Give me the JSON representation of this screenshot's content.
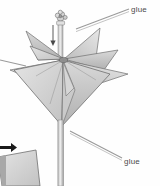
{
  "illustration": {
    "title": "Folded paper star flower on a stick",
    "type": "craft-assembly-diagram",
    "background_color": "#fefefe"
  },
  "labels": {
    "top_glue": "glue",
    "bottom_glue": "glue",
    "left_glue_partial": "e"
  },
  "parts": {
    "ornament_name": "bead-flower-ornament",
    "stick_name": "wooden-stick",
    "star_name": "folded-paper-star",
    "arrow_name": "slide-down-arrow",
    "corner_shape_name": "adjacent-figure-fragment",
    "corner_arrow_name": "black-pointer-arrow"
  },
  "colors": {
    "paper_light": "#dedede",
    "paper_mid": "#cfcfcf",
    "paper_dark": "#b4b4b4",
    "paper_shadow": "#a2a2a2",
    "outline": "#6e6e6e",
    "leader_line": "#9a9a9a",
    "text": "#4b4b4b",
    "accent_black": "#1a1a1a"
  }
}
